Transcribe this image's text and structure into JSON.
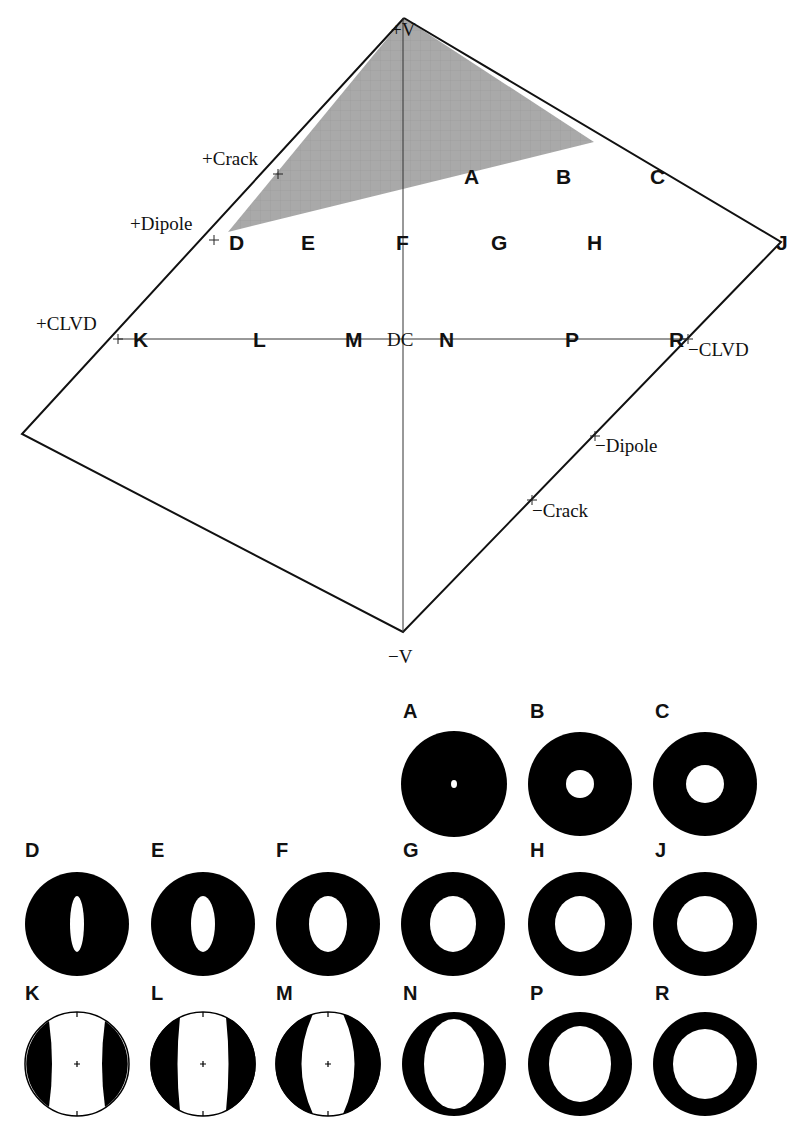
{
  "diagram": {
    "axis_labels": {
      "top": "+V",
      "bottom": "−V",
      "center": "DC",
      "plus_crack": "+Crack",
      "plus_dipole": "+Dipole",
      "plus_clvd": "+CLVD",
      "minus_clvd": "−CLVD",
      "minus_dipole": "−Dipole",
      "minus_crack": "−Crack"
    },
    "colors": {
      "shaded_region": "#a9a9a9",
      "outline": "#111111",
      "beachball_fill": "#000000",
      "background": "#ffffff"
    },
    "points": [
      {
        "label": "A"
      },
      {
        "label": "B"
      },
      {
        "label": "C"
      },
      {
        "label": "D"
      },
      {
        "label": "E"
      },
      {
        "label": "F"
      },
      {
        "label": "G"
      },
      {
        "label": "H"
      },
      {
        "label": "J"
      },
      {
        "label": "K"
      },
      {
        "label": "L"
      },
      {
        "label": "M"
      },
      {
        "label": "N"
      },
      {
        "label": "P"
      },
      {
        "label": "R"
      }
    ]
  },
  "beachballs": {
    "row1": [
      {
        "label": "A",
        "hole": "tiny dot"
      },
      {
        "label": "B",
        "hole": "small circle"
      },
      {
        "label": "C",
        "hole": "medium circle"
      }
    ],
    "row2": [
      {
        "label": "D",
        "hole": "narrow vertical ellipse"
      },
      {
        "label": "E",
        "hole": "vertical ellipse"
      },
      {
        "label": "F",
        "hole": "wider ellipse"
      },
      {
        "label": "G",
        "hole": "large ellipse"
      },
      {
        "label": "H",
        "hole": "large near-circle"
      },
      {
        "label": "J",
        "hole": "large circle"
      }
    ],
    "row3": [
      {
        "label": "K",
        "pattern": "two dark side lobes"
      },
      {
        "label": "L",
        "pattern": "two dark side lobes"
      },
      {
        "label": "M",
        "pattern": "two dark crescent lobes"
      },
      {
        "label": "N",
        "hole": "tall ellipse"
      },
      {
        "label": "P",
        "hole": "large ellipse"
      },
      {
        "label": "R",
        "hole": "large circle"
      }
    ]
  }
}
